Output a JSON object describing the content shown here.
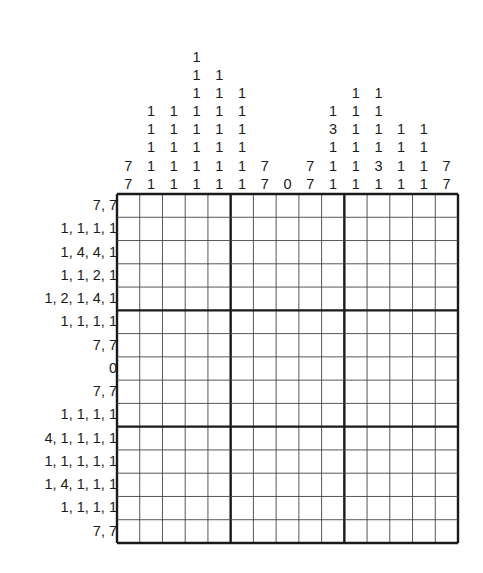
{
  "puzzle": {
    "type": "nonogram",
    "size": {
      "rows": 15,
      "cols": 15
    },
    "block_size": 5,
    "line_color": "#1a1a1a",
    "column_clues": [
      [
        "7",
        "7"
      ],
      [
        "1",
        "1",
        "1",
        "1",
        "1"
      ],
      [
        "1",
        "1",
        "1",
        "1",
        "1"
      ],
      [
        "1",
        "1",
        "1",
        "1",
        "1",
        "1",
        "1",
        "1"
      ],
      [
        "1",
        "1",
        "1",
        "1",
        "1",
        "1",
        "1"
      ],
      [
        "1",
        "1",
        "1",
        "1",
        "1",
        "1"
      ],
      [
        "7",
        "7"
      ],
      [
        "0"
      ],
      [
        "7",
        "7"
      ],
      [
        "1",
        "3",
        "1",
        "1",
        "1"
      ],
      [
        "1",
        "1",
        "1",
        "1",
        "1",
        "1"
      ],
      [
        "1",
        "1",
        "1",
        "1",
        "3",
        "1"
      ],
      [
        "1",
        "1",
        "1",
        "1"
      ],
      [
        "1",
        "1",
        "1",
        "1"
      ],
      [
        "7",
        "7"
      ]
    ],
    "row_clues": [
      "7, 7",
      "1, 1, 1, 1",
      "1, 4, 4, 1",
      "1, 1, 2, 1",
      "1, 2, 1, 4, 1",
      "1, 1, 1, 1",
      "7, 7",
      "0",
      "7, 7",
      "1, 1, 1, 1",
      "4, 1, 1, 1, 1",
      "1, 1, 1, 1, 1",
      "1, 4, 1, 1, 1",
      "1, 1, 1, 1",
      "7, 7"
    ]
  }
}
